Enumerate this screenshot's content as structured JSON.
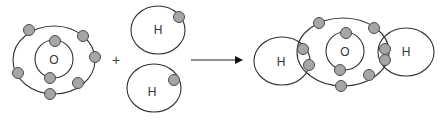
{
  "diagram": {
    "type": "chemical-reaction-bohr-model",
    "colors": {
      "orbit": "#333333",
      "electron_fill": "#a6a6a6",
      "electron_stroke": "#4d4d4d",
      "text": "#333333",
      "background": "#ffffff"
    },
    "reactants": {
      "oxygen": {
        "label": "O",
        "inner_shell_electrons": 2,
        "outer_shell_electrons": 6
      },
      "hydrogen_top": {
        "label": "H",
        "electrons": 1
      },
      "hydrogen_bottom": {
        "label": "H",
        "electrons": 1
      }
    },
    "operator": {
      "plus": "+"
    },
    "arrow": {
      "direction": "right"
    },
    "product": {
      "oxygen": {
        "label": "O"
      },
      "hydrogen_left": {
        "label": "H"
      },
      "hydrogen_right": {
        "label": "H"
      },
      "total_electrons": 10
    }
  }
}
